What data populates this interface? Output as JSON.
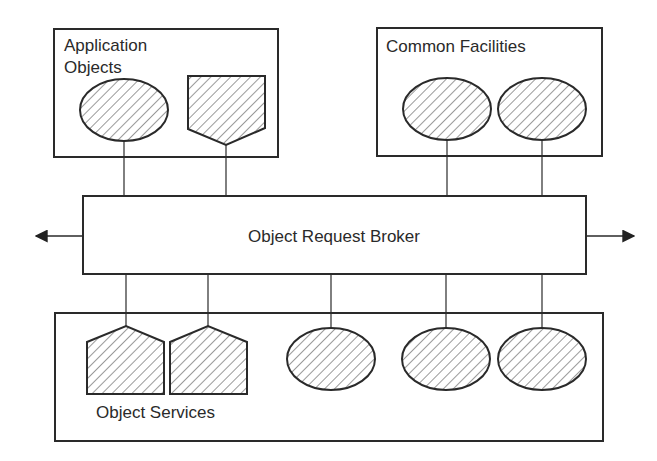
{
  "diagram": {
    "type": "architecture-block",
    "colors": {
      "stroke": "#2a2a2a",
      "hatch": "#555555",
      "background": "#ffffff"
    },
    "application_objects": {
      "label_line1": "Application",
      "label_line2": "Objects",
      "members": [
        "ellipse",
        "pentagon-down"
      ]
    },
    "common_facilities": {
      "label": "Common Facilities",
      "members": [
        "ellipse",
        "ellipse"
      ]
    },
    "orb": {
      "label": "Object Request Broker",
      "arrows": [
        "left",
        "right"
      ]
    },
    "object_services": {
      "label": "Object Services",
      "members": [
        "pentagon-up",
        "pentagon-up",
        "ellipse",
        "ellipse",
        "ellipse"
      ]
    }
  }
}
